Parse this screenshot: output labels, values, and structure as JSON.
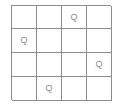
{
  "puzzle": {
    "type": "n-queens",
    "size": 4,
    "queen_symbol": "Q",
    "grid_line_color": "#8c8c8c",
    "queen_color": "#8a8a8a",
    "rows": [
      [
        "",
        "",
        "Q",
        ""
      ],
      [
        "Q",
        "",
        "",
        ""
      ],
      [
        "",
        "",
        "",
        "Q"
      ],
      [
        "",
        "Q",
        "",
        ""
      ]
    ],
    "queen_positions": [
      {
        "row": 0,
        "col": 2
      },
      {
        "row": 1,
        "col": 0
      },
      {
        "row": 2,
        "col": 3
      },
      {
        "row": 3,
        "col": 1
      }
    ]
  }
}
